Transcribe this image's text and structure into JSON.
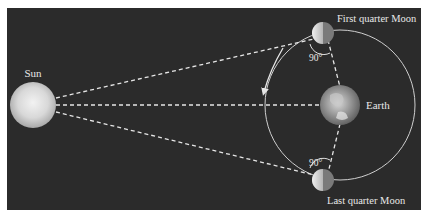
{
  "figure": {
    "background_color": "#2b2b2b",
    "labels": {
      "sun": "Sun",
      "earth": "Earth",
      "first_quarter_moon": "First quarter Moon",
      "last_quarter_moon": "Last quarter Moon",
      "angle_top": "90°",
      "angle_bottom": "90°"
    },
    "elements": {
      "sun": {
        "cx": 33,
        "cy": 105,
        "r": 23
      },
      "earth": {
        "cx": 340,
        "cy": 105,
        "r": 20
      },
      "orbit": {
        "cx": 340,
        "cy": 105,
        "r": 75
      },
      "first_quarter_moon": {
        "cx": 323,
        "cy": 33
      },
      "last_quarter_moon": {
        "cx": 323,
        "cy": 180
      }
    },
    "orbit_direction": "counterclockwise"
  }
}
